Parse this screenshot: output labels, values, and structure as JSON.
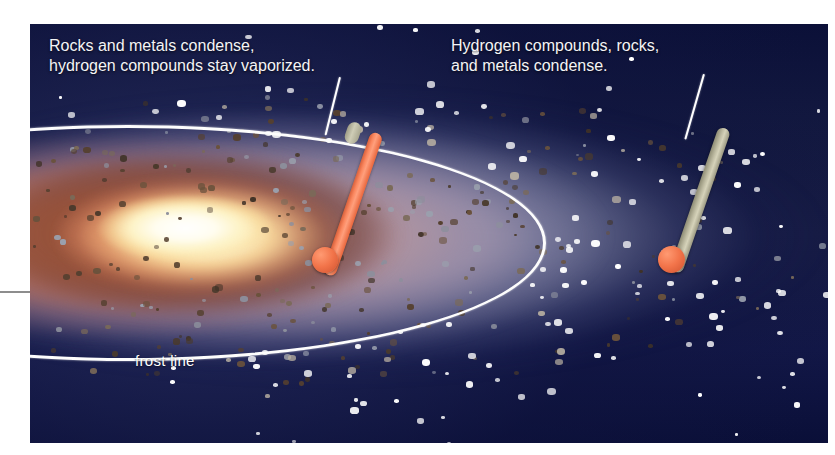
{
  "figure": {
    "background_color": "#0c1140",
    "callouts": [
      {
        "id": "inner",
        "text": "Rocks and metals condense,\nhydrogen compounds stay vaporized.",
        "leader_to": "hot-thermometer"
      },
      {
        "id": "outer",
        "text": "Hydrogen compounds, rocks,\nand metals condense.",
        "leader_to": "cold-thermometer"
      }
    ],
    "frost_line": {
      "label": "frost line",
      "color": "#ffffff"
    },
    "thermometers": [
      {
        "id": "hot-thermometer",
        "region": "inside frost line",
        "reading": "high",
        "mercury_color": "#f2744a",
        "fill_fraction": 0.95
      },
      {
        "id": "cold-thermometer",
        "region": "outside frost line",
        "reading": "low",
        "mercury_color": "#f2744a",
        "fill_fraction": 0.08
      }
    ],
    "star": {
      "name": "protostar",
      "core_color": "#fffdf0",
      "glow_color": "#fdf3c8"
    },
    "disk": {
      "inner_color": "#cc7654",
      "mid_color": "#b48c92",
      "outer_color": "#c4c4d6",
      "dust_speck_color": "#5a4432",
      "ice_grain_color": "#ffffff"
    }
  }
}
